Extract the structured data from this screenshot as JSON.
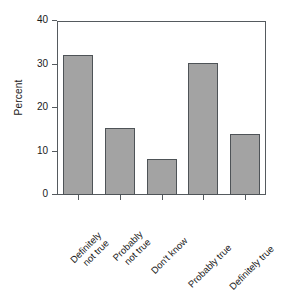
{
  "chart_data": {
    "type": "bar",
    "title": "",
    "xlabel": "",
    "ylabel": "Percent",
    "categories": [
      "Definitely\nnot true",
      "Probably\nnot true",
      "Don't know",
      "Probably true",
      "Definitely true"
    ],
    "category_labels": [
      [
        "Definitely",
        "not true"
      ],
      [
        "Probably",
        "not true"
      ],
      [
        "Don't know"
      ],
      [
        "Probably true"
      ],
      [
        "Definitely true"
      ]
    ],
    "values": [
      32.3,
      15.5,
      8.2,
      30.3,
      14.0
    ],
    "ylim": [
      0,
      40
    ],
    "yticks": [
      0,
      10,
      20,
      30,
      40
    ],
    "ytick_labels": [
      "0",
      "10",
      "20",
      "30",
      "40"
    ],
    "grid": false,
    "legend": null,
    "bar_color": "#a3a3a3",
    "bar_edge_color": "#4e5357",
    "axis_color": "#555a5e",
    "background": "#ffffff"
  }
}
